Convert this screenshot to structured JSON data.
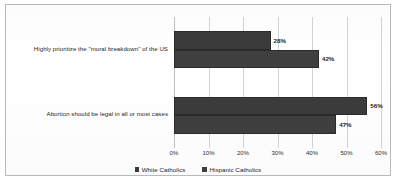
{
  "chart_data": {
    "type": "bar",
    "orientation": "horizontal",
    "title": "",
    "subtitle": "",
    "xlabel": "",
    "ylabel": "",
    "xlim": [
      0,
      60
    ],
    "x_tick_labels": [
      "0%",
      "10%",
      "20%",
      "30%",
      "40%",
      "50%",
      "60%"
    ],
    "x_tick_values": [
      0,
      10,
      20,
      30,
      40,
      50,
      60
    ],
    "grid": true,
    "legend_position": "bottom",
    "categories": [
      "Highly prioritize the \"moral breakdown\" of the US",
      "Abortion should be legal in all or most cases"
    ],
    "series": [
      {
        "name": "White Catholics",
        "color": "#3b3b3b",
        "values": [
          28,
          56
        ],
        "value_labels": [
          "28%",
          "56%"
        ]
      },
      {
        "name": "Hispanic Catholics",
        "color": "#3f3f3f",
        "values": [
          42,
          47
        ],
        "value_labels": [
          "42%",
          "47%"
        ]
      }
    ]
  },
  "legend": {
    "items": [
      {
        "label": "White Catholics",
        "color": "#3b3b3b"
      },
      {
        "label": "Hispanic Catholics",
        "color": "#3f3f3f"
      }
    ]
  }
}
